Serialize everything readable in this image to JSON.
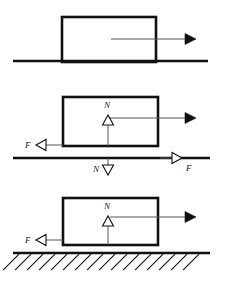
{
  "figure": {
    "background_color": "#ffffff",
    "stroke_color": "#111111",
    "thin_stroke_color": "#555555",
    "width": 226,
    "height": 281,
    "panels": [
      {
        "id": "panel-1",
        "caption": "Block on surface with applied force",
        "block": {
          "x": 62,
          "y": 17,
          "width": 94,
          "height": 45
        },
        "ground": {
          "x1": 13,
          "y": 61,
          "x2": 208
        },
        "arrows": [
          {
            "name": "applied-force-arrow",
            "style": "solid-filled",
            "direction": "right",
            "label": "",
            "x1": 111,
            "y1": 39,
            "x2": 196,
            "y2": 39
          }
        ],
        "labels": []
      },
      {
        "id": "panel-2",
        "caption": "Action-reaction pairs between block and surface",
        "block": {
          "x": 63,
          "y": 97,
          "width": 95,
          "height": 49
        },
        "ground": {
          "x1": 13,
          "y": 158,
          "x2": 210
        },
        "arrows": [
          {
            "name": "applied-force-arrow",
            "style": "solid-filled",
            "direction": "right",
            "label": "",
            "x1": 110,
            "y1": 118,
            "x2": 196,
            "y2": 118
          },
          {
            "name": "normal-force-up-arrow",
            "style": "hollow-triangle",
            "direction": "up",
            "label": "N",
            "label_x": 104,
            "label_y": 108,
            "x1": 108,
            "y1": 146,
            "x2": 108,
            "y2": 115
          },
          {
            "name": "friction-on-block-arrow",
            "style": "hollow-triangle",
            "direction": "left",
            "label": "F",
            "label_x": 25,
            "label_y": 148,
            "x1": 63,
            "y1": 145,
            "x2": 36,
            "y2": 145
          },
          {
            "name": "normal-reaction-down-arrow",
            "style": "hollow-triangle",
            "direction": "down",
            "label": "N",
            "label_x": 93,
            "label_y": 172,
            "x1": 108,
            "y1": 158,
            "x2": 108,
            "y2": 175
          },
          {
            "name": "friction-reaction-right-arrow",
            "style": "hollow-triangle",
            "direction": "right",
            "label": "F",
            "label_x": 186,
            "label_y": 171,
            "x1": 160,
            "y1": 158,
            "x2": 182,
            "y2": 158
          }
        ],
        "labels": [
          {
            "name": "normal-force-label",
            "text": "N"
          },
          {
            "name": "friction-force-label",
            "text": "F"
          },
          {
            "name": "normal-reaction-label",
            "text": "N"
          },
          {
            "name": "friction-reaction-label",
            "text": "F"
          }
        ]
      },
      {
        "id": "panel-3",
        "caption": "Block on hatched fixed ground",
        "block": {
          "x": 63,
          "y": 198,
          "width": 95,
          "height": 47
        },
        "ground": {
          "x1": 13,
          "y": 253,
          "x2": 210
        },
        "hatching": {
          "name": "ground-hatching",
          "count": 16,
          "angle_deg": 45,
          "length": 16,
          "spacing": 12
        },
        "arrows": [
          {
            "name": "applied-force-arrow",
            "style": "solid-filled",
            "direction": "right",
            "label": "",
            "x1": 110,
            "y1": 217,
            "x2": 196,
            "y2": 217
          },
          {
            "name": "normal-force-up-arrow",
            "style": "hollow-triangle",
            "direction": "up",
            "label": "N",
            "label_x": 104,
            "label_y": 209,
            "x1": 108,
            "y1": 245,
            "x2": 108,
            "y2": 216
          },
          {
            "name": "friction-on-block-arrow",
            "style": "hollow-triangle",
            "direction": "left",
            "label": "F",
            "label_x": 25,
            "label_y": 243,
            "x1": 63,
            "y1": 240,
            "x2": 36,
            "y2": 240
          }
        ],
        "labels": [
          {
            "name": "normal-force-label",
            "text": "N"
          },
          {
            "name": "friction-force-label",
            "text": "F"
          }
        ]
      }
    ]
  }
}
